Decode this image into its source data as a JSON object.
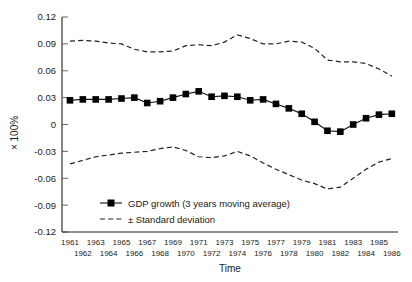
{
  "chart_data": {
    "type": "line",
    "title": "",
    "xlabel": "Time",
    "ylabel": "× 100%",
    "ylim": [
      -0.12,
      0.12
    ],
    "yticks": [
      0.12,
      0.09,
      0.06,
      0.03,
      0,
      -0.03,
      -0.06,
      -0.09,
      -0.12
    ],
    "ytick_labels": [
      "0.12",
      "0.09",
      "0.06",
      "0.03",
      "0",
      "-0.03",
      "-0.06",
      "-0.09",
      "-0.12"
    ],
    "grid": false,
    "legend_position": "inside-bottom-left",
    "x": [
      1961,
      1962,
      1963,
      1964,
      1965,
      1966,
      1967,
      1968,
      1969,
      1970,
      1971,
      1972,
      1973,
      1974,
      1975,
      1976,
      1977,
      1978,
      1979,
      1980,
      1981,
      1982,
      1983,
      1984,
      1985,
      1986
    ],
    "xtick_labels_top": [
      "1961",
      "1963",
      "1965",
      "1967",
      "1969",
      "1971",
      "1973",
      "1975",
      "1977",
      "1979",
      "1981",
      "1983",
      "1985"
    ],
    "xtick_labels_bottom": [
      "1962",
      "1964",
      "1966",
      "1968",
      "1970",
      "1972",
      "1974",
      "1976",
      "1978",
      "1980",
      "1982",
      "1984",
      "1986"
    ],
    "series": [
      {
        "name": "GDP growth (3 years moving average)",
        "style": "solid-with-square-markers",
        "values": [
          0.027,
          0.028,
          0.028,
          0.028,
          0.029,
          0.03,
          0.024,
          0.026,
          0.03,
          0.034,
          0.037,
          0.031,
          0.032,
          0.031,
          0.027,
          0.028,
          0.023,
          0.018,
          0.012,
          0.003,
          -0.007,
          -0.008,
          0.0,
          0.007,
          0.011,
          0.012
        ]
      },
      {
        "name": "+ Standard deviation",
        "style": "dashed",
        "values": [
          0.093,
          0.094,
          0.093,
          0.091,
          0.09,
          0.084,
          0.081,
          0.081,
          0.082,
          0.088,
          0.089,
          0.088,
          0.092,
          0.1,
          0.096,
          0.09,
          0.09,
          0.093,
          0.092,
          0.085,
          0.072,
          0.07,
          0.07,
          0.068,
          0.062,
          0.054
        ]
      },
      {
        "name": "- Standard deviation",
        "style": "dashed",
        "values": [
          -0.044,
          -0.04,
          -0.036,
          -0.034,
          -0.032,
          -0.031,
          -0.03,
          -0.027,
          -0.025,
          -0.029,
          -0.036,
          -0.037,
          -0.035,
          -0.03,
          -0.035,
          -0.043,
          -0.05,
          -0.056,
          -0.062,
          -0.066,
          -0.072,
          -0.07,
          -0.06,
          -0.05,
          -0.042,
          -0.038
        ]
      }
    ]
  },
  "legend": {
    "items": [
      {
        "label": "GDP growth (3 years moving average)",
        "marker": "line-square-marker"
      },
      {
        "label": "± Standard deviation",
        "marker": "dashed-line"
      }
    ]
  }
}
